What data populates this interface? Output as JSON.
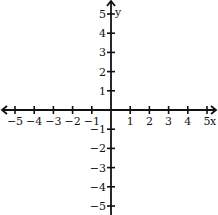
{
  "chart_data": {
    "type": "coordinate-plane",
    "title": "",
    "xlabel": "x",
    "ylabel": "y",
    "xlim": [
      -5,
      5
    ],
    "ylim": [
      -5,
      5
    ],
    "x_ticks": [
      -5,
      -4,
      -3,
      -2,
      -1,
      1,
      2,
      3,
      4,
      5
    ],
    "y_ticks": [
      -5,
      -4,
      -3,
      -2,
      -1,
      1,
      2,
      3,
      4,
      5
    ],
    "x_tick_labels": [
      "-5",
      "-4",
      "-3",
      "-2",
      "-1",
      "1",
      "2",
      "3",
      "4",
      "5"
    ],
    "y_tick_labels": [
      "-5",
      "-4",
      "-3",
      "-2",
      "-1",
      "1",
      "2",
      "3",
      "4",
      "5"
    ],
    "grid": false,
    "x_axis_arrows": [
      "left",
      "right"
    ],
    "y_axis_arrows": [
      "up"
    ],
    "series": []
  },
  "layout": {
    "origin_px": [
      111,
      110
    ],
    "unit_px": 19.2,
    "axis_color": "#111111",
    "background": "#ffffff"
  }
}
